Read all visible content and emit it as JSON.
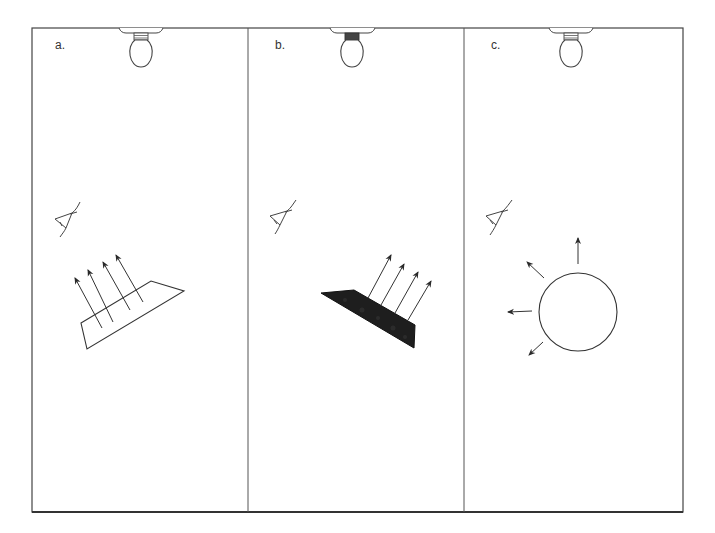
{
  "diagram": {
    "colors": {
      "line": "#3a3a3a",
      "frame": "#444444",
      "dark_surface": "#1e1e1e",
      "background": "#ffffff"
    },
    "panels": [
      {
        "id": "a",
        "label": "a.",
        "surface": "light flat plane",
        "reflection": "specular (parallel rays reflected upward)",
        "arrow_count": 4
      },
      {
        "id": "b",
        "label": "b.",
        "surface": "dark flat plane",
        "reflection": "specular (parallel rays reflected upward)",
        "arrow_count": 4
      },
      {
        "id": "c",
        "label": "c.",
        "surface": "sphere",
        "reflection": "diffuse (rays scattered in many directions)",
        "arrow_count": 4
      }
    ],
    "elements_per_panel": [
      "light-bulb",
      "eye",
      "surface",
      "reflection-arrows"
    ]
  }
}
